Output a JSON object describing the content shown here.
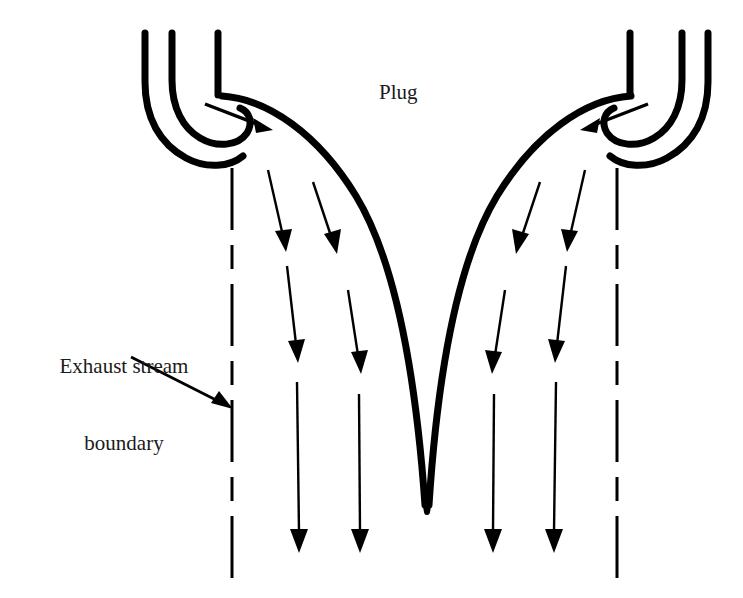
{
  "diagram": {
    "background_color": "#ffffff",
    "ink_color": "#000000",
    "labels": {
      "plug": "Plug",
      "boundary_line_1": "Exhaust stream",
      "boundary_line_2": "boundary"
    },
    "geometry": {
      "heavy_stroke_width": 7,
      "thin_stroke_width": 2.4,
      "dash_pattern": "60 14 22 14",
      "left_boundary_x": 232,
      "right_boundary_x": 617,
      "boundary_top_y": 168,
      "boundary_bottom_y": 578,
      "plug_tip_x": 427,
      "plug_tip_y": 512,
      "nozzle_top_y": 33
    },
    "flow_arrows": {
      "inlet_count": 2,
      "exhaust_columns_per_side": 2,
      "exhaust_rows": 3,
      "total_exhaust_arrows": 12
    }
  }
}
